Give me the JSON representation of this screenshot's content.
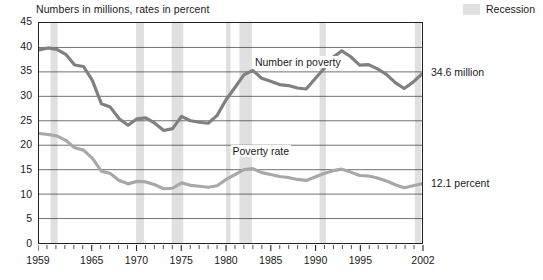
{
  "header": {
    "axis_note": "Numbers in millions, rates in percent",
    "legend_label": "Recession",
    "legend_color": "#e0e0e0"
  },
  "annotations": {
    "number_label": "Number in poverty",
    "rate_label": "Poverty rate",
    "number_end_label": "34.6 million",
    "rate_end_label": "12.1 percent"
  },
  "chart_data": {
    "type": "line",
    "title": "",
    "subtitle": "Numbers in millions, rates in percent",
    "xlabel": "",
    "ylabel": "",
    "xlim": [
      1959,
      2002
    ],
    "ylim": [
      0,
      45
    ],
    "ytick_values": [
      0,
      5,
      10,
      15,
      20,
      25,
      30,
      35,
      40,
      45
    ],
    "ytick_labels": [
      "0",
      "5",
      "10",
      "15",
      "20",
      "25",
      "30",
      "35",
      "40",
      "45"
    ],
    "xtick_values": [
      1959,
      1965,
      1970,
      1975,
      1980,
      1985,
      1990,
      1995,
      2002
    ],
    "xtick_labels": [
      "1959",
      "1965",
      "1970",
      "1975",
      "1980",
      "1985",
      "1990",
      "1995",
      "2002"
    ],
    "xtick_minor_step": 1,
    "grid": "horizontal",
    "legend_position": "top-right",
    "x": [
      1959,
      1960,
      1961,
      1962,
      1963,
      1964,
      1965,
      1966,
      1967,
      1968,
      1969,
      1970,
      1971,
      1972,
      1973,
      1974,
      1975,
      1976,
      1977,
      1978,
      1979,
      1980,
      1981,
      1982,
      1983,
      1984,
      1985,
      1986,
      1987,
      1988,
      1989,
      1990,
      1991,
      1992,
      1993,
      1994,
      1995,
      1996,
      1997,
      1998,
      1999,
      2000,
      2001,
      2002
    ],
    "series": [
      {
        "name": "Number in poverty",
        "unit": "millions",
        "color": "#808080",
        "values": [
          39.5,
          39.9,
          39.6,
          38.6,
          36.4,
          36.1,
          33.2,
          28.5,
          27.8,
          25.4,
          24.1,
          25.4,
          25.6,
          24.5,
          23.0,
          23.4,
          25.9,
          25.0,
          24.7,
          24.5,
          26.1,
          29.3,
          31.8,
          34.4,
          35.3,
          33.7,
          33.1,
          32.4,
          32.2,
          31.7,
          31.5,
          33.6,
          35.7,
          38.0,
          39.3,
          38.1,
          36.4,
          36.5,
          35.6,
          34.5,
          32.8,
          31.6,
          32.9,
          34.6
        ]
      },
      {
        "name": "Poverty rate",
        "unit": "percent",
        "color": "#a8a8a8",
        "values": [
          22.4,
          22.2,
          21.9,
          21.0,
          19.5,
          19.0,
          17.3,
          14.7,
          14.2,
          12.8,
          12.1,
          12.6,
          12.5,
          11.9,
          11.1,
          11.2,
          12.3,
          11.8,
          11.6,
          11.4,
          11.7,
          13.0,
          14.0,
          15.0,
          15.2,
          14.4,
          14.0,
          13.6,
          13.4,
          13.0,
          12.8,
          13.5,
          14.2,
          14.8,
          15.1,
          14.5,
          13.8,
          13.7,
          13.3,
          12.7,
          11.9,
          11.3,
          11.7,
          12.1
        ]
      }
    ],
    "recessions": [
      {
        "start": 1960.3,
        "end": 1961.1
      },
      {
        "start": 1969.9,
        "end": 1970.8
      },
      {
        "start": 1973.9,
        "end": 1975.2
      },
      {
        "start": 1980.0,
        "end": 1980.5
      },
      {
        "start": 1981.5,
        "end": 1982.9
      },
      {
        "start": 1990.5,
        "end": 1991.2
      },
      {
        "start": 2001.2,
        "end": 2001.9
      }
    ]
  }
}
